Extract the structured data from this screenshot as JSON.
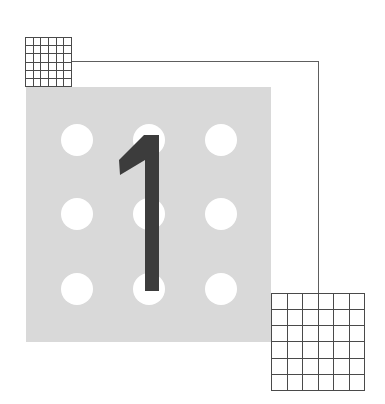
{
  "figure": {
    "numeral": "1",
    "colors": {
      "background": "#ffffff",
      "square": "#d9d9d9",
      "dots": "#ffffff",
      "numeral": "#3c3c3c",
      "lines": "#5e5e5e",
      "grid": "#4a4a4a"
    },
    "dots": {
      "rows": 3,
      "cols": 3
    },
    "small_grid": {
      "rows": 6,
      "cols": 6
    },
    "large_grid": {
      "rows": 6,
      "cols": 6
    }
  }
}
